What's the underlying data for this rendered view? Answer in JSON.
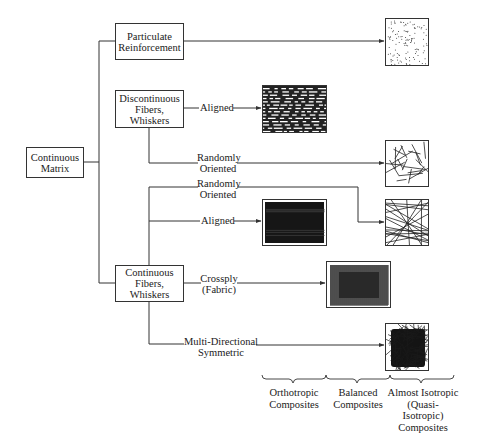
{
  "diagram": {
    "root": {
      "label": "Continuous Matrix"
    },
    "categories": [
      {
        "id": "particulate",
        "label": "Particulate Reinforcement"
      },
      {
        "id": "discontinuous",
        "label": "Discontinuous Fibers, Whiskers"
      },
      {
        "id": "continuous",
        "label": "Continuous Fibers, Whiskers"
      }
    ],
    "branches": {
      "disc_aligned": "Aligned",
      "disc_random": "Randomly Oriented",
      "cont_random": "Randomly Oriented",
      "cont_aligned": "Aligned",
      "cont_crossply": "Crossply (Fabric)",
      "cont_multi": "Multi-Directional Symmetric"
    },
    "illustrations": [
      {
        "id": "particles",
        "depicts": "dispersed particles"
      },
      {
        "id": "short-aligned",
        "depicts": "aligned short fibers"
      },
      {
        "id": "short-random",
        "depicts": "randomly oriented short fibers"
      },
      {
        "id": "long-random",
        "depicts": "randomly oriented continuous fibers"
      },
      {
        "id": "long-aligned",
        "depicts": "aligned continuous fibers"
      },
      {
        "id": "crossply",
        "depicts": "woven crossply fabric"
      },
      {
        "id": "multi",
        "depicts": "multi-directional fibers"
      }
    ],
    "groups": [
      {
        "label": "Orthotropic Composites"
      },
      {
        "label": "Balanced Composites"
      },
      {
        "label": "Almost Isotropic (Quasi-Isotropic) Composites"
      }
    ],
    "colors": {
      "line": "#333333",
      "fill": "#1a1a1a",
      "background": "#ffffff"
    }
  },
  "labels": {
    "root_l1": "Continuous",
    "root_l2": "Matrix",
    "part_l1": "Particulate",
    "part_l2": "Reinforcement",
    "disc_l1": "Discontinuous",
    "disc_l2": "Fibers,",
    "disc_l3": "Whiskers",
    "cont_l1": "Continuous",
    "cont_l2": "Fibers,",
    "cont_l3": "Whiskers",
    "aligned1": "Aligned",
    "rand1_l1": "Randomly",
    "rand1_l2": "Oriented",
    "rand2_l1": "Randomly",
    "rand2_l2": "Oriented",
    "aligned2": "Aligned",
    "cross_l1": "Crossply",
    "cross_l2": "(Fabric)",
    "multi_l1": "Multi-Directional",
    "multi_l2": "Symmetric",
    "g1_l1": "Orthotropic",
    "g1_l2": "Composites",
    "g2_l1": "Balanced",
    "g2_l2": "Composites",
    "g3_l1": "Almost Isotropic",
    "g3_l2": "(Quasi-Isotropic)",
    "g3_l3": "Composites"
  }
}
